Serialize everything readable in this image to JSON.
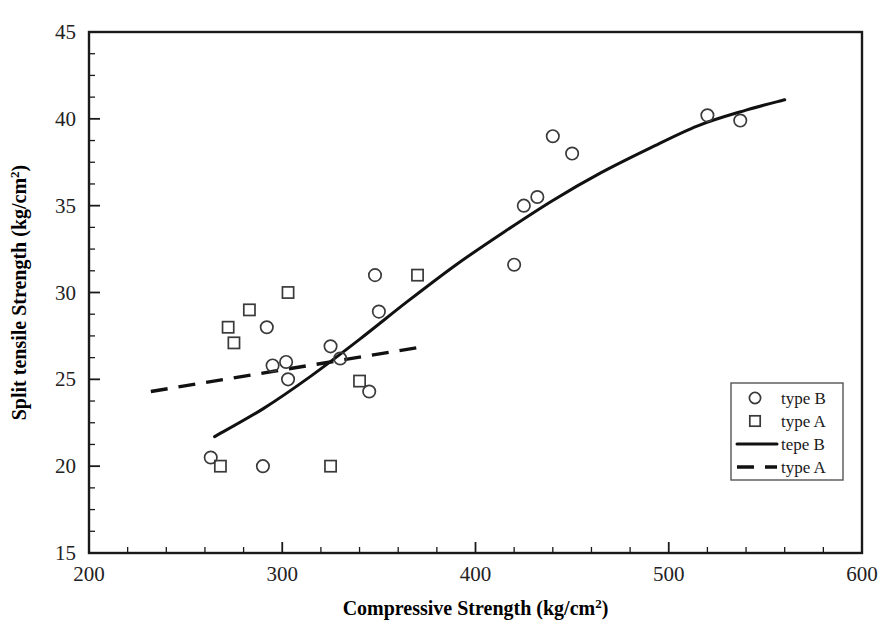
{
  "chart_data": {
    "type": "scatter",
    "title": "",
    "xlabel": "Compressive Strength (kg/cm2)",
    "xlabel_base": "Compressive Strength (kg/cm",
    "xlabel_sup": "2",
    "xlabel_tail": ")",
    "ylabel": "Split tensile Strength (kg/cm2)",
    "ylabel_base": "Split tensile Strength (kg/cm",
    "ylabel_sup": "2",
    "ylabel_tail": ")",
    "xlim": [
      200,
      600
    ],
    "ylim": [
      15,
      45
    ],
    "xticks": [
      200,
      300,
      400,
      500,
      600
    ],
    "yticks": [
      15,
      20,
      25,
      30,
      35,
      40,
      45
    ],
    "x_minor_step": 20,
    "y_minor_step": 1.25,
    "grid": false,
    "legend_position": "right-lower",
    "series": [
      {
        "name": "type B",
        "marker": "circle",
        "points": [
          [
            263,
            20.5
          ],
          [
            290,
            20.0
          ],
          [
            292,
            28.0
          ],
          [
            295,
            25.8
          ],
          [
            302,
            26.0
          ],
          [
            303,
            25.0
          ],
          [
            325,
            26.9
          ],
          [
            330,
            26.2
          ],
          [
            348,
            31.0
          ],
          [
            345,
            24.3
          ],
          [
            350,
            28.9
          ],
          [
            420,
            31.6
          ],
          [
            425,
            35.0
          ],
          [
            432,
            35.5
          ],
          [
            440,
            39.0
          ],
          [
            450,
            38.0
          ],
          [
            520,
            40.2
          ],
          [
            537,
            39.9
          ]
        ]
      },
      {
        "name": "type A",
        "marker": "square",
        "points": [
          [
            268,
            20.0
          ],
          [
            272,
            28.0
          ],
          [
            275,
            27.1
          ],
          [
            283,
            29.0
          ],
          [
            303,
            30.0
          ],
          [
            325,
            20.0
          ],
          [
            340,
            24.9
          ],
          [
            370,
            31.0
          ]
        ]
      }
    ],
    "fits": [
      {
        "name": "tepe B",
        "style": "solid",
        "points": [
          [
            265,
            21.7
          ],
          [
            290,
            23.3
          ],
          [
            315,
            25.2
          ],
          [
            340,
            27.3
          ],
          [
            365,
            29.5
          ],
          [
            390,
            31.6
          ],
          [
            415,
            33.5
          ],
          [
            440,
            35.3
          ],
          [
            465,
            36.9
          ],
          [
            490,
            38.3
          ],
          [
            515,
            39.6
          ],
          [
            540,
            40.5
          ],
          [
            560,
            41.1
          ]
        ]
      },
      {
        "name": "type A",
        "style": "dashed",
        "points": [
          [
            232,
            24.3
          ],
          [
            374,
            26.9
          ]
        ]
      }
    ],
    "legend_entries": [
      {
        "label": "type B",
        "kind": "marker",
        "marker": "circle"
      },
      {
        "label": "type A",
        "kind": "marker",
        "marker": "square"
      },
      {
        "label": "tepe B",
        "kind": "line",
        "style": "solid"
      },
      {
        "label": "type A",
        "kind": "line",
        "style": "dashed"
      }
    ],
    "colors": {
      "axis": "#1a1a1a",
      "marker": "#3a3a3a",
      "fit": "#111111",
      "background": "#ffffff"
    }
  }
}
